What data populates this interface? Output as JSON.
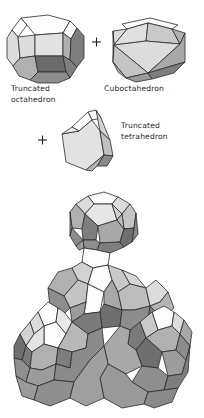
{
  "figure": {
    "title_visible": false,
    "background_color": "#ffffff",
    "outline_color": "#2b2b2b",
    "operators": [
      {
        "symbol": "+",
        "name": "plus-operator-1"
      },
      {
        "symbol": "+",
        "name": "plus-operator-2"
      }
    ],
    "palette": {
      "white_face": "#fdfdfd",
      "light_face": "#dcdcdc",
      "mid_face": "#b0b0b0",
      "dark_face": "#7e7e7e",
      "darker_face": "#6a6a6a",
      "edge": "#2b2b2b"
    },
    "components": [
      {
        "id": "truncated-octahedron",
        "label_line1": "Truncated",
        "label_line2": "octahedron",
        "full_label": "Truncated octahedron"
      },
      {
        "id": "cuboctahedron",
        "label_line1": "Cuboctahedron",
        "label_line2": "",
        "full_label": "Cuboctahedron"
      },
      {
        "id": "truncated-tetrahedron",
        "label_line1": "Truncated",
        "label_line2": "tetrahedron",
        "full_label": "Truncated tetrahedron"
      }
    ],
    "assembly": {
      "id": "space-filling-assembly",
      "description_visible": false
    }
  }
}
